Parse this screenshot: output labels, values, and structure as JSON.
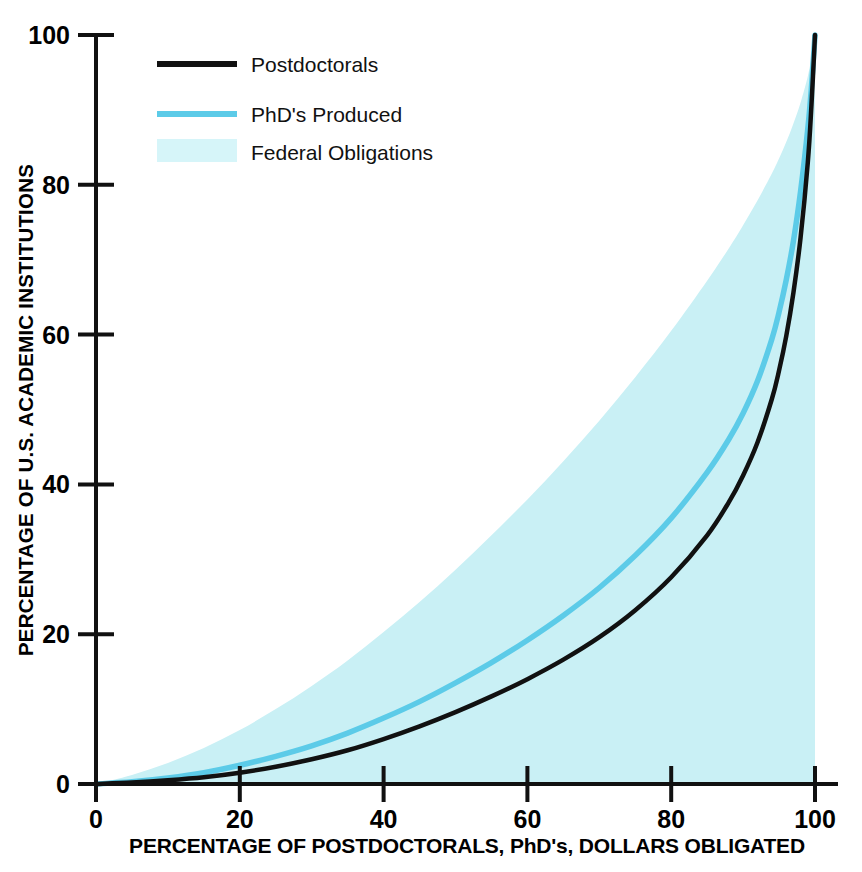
{
  "chart_data": {
    "type": "line",
    "title": "",
    "xlabel": "PERCENTAGE OF POSTDOCTORALS, PhD's, DOLLARS OBLIGATED",
    "ylabel": "PERCENTAGE OF U.S. ACADEMIC INSTITUTIONS",
    "xlim": [
      0,
      100
    ],
    "ylim": [
      0,
      100
    ],
    "xticks": [
      "0",
      "20",
      "40",
      "60",
      "80",
      "100"
    ],
    "xtick_values": [
      0,
      20,
      40,
      60,
      80,
      100
    ],
    "yticks": [
      "0",
      "20",
      "40",
      "60",
      "80",
      "100"
    ],
    "ytick_values": [
      0,
      20,
      40,
      60,
      80,
      100
    ],
    "grid": false,
    "legend_position": "top-left-inside",
    "colors": {
      "postdoctorals_line": "#111111",
      "phds_line": "#5ccbe8",
      "federal_fill": "#c9f0f5",
      "axis": "#111111",
      "background": "#ffffff"
    },
    "x": [
      0,
      5,
      10,
      15,
      20,
      25,
      30,
      35,
      40,
      45,
      50,
      55,
      60,
      65,
      70,
      75,
      80,
      85,
      88,
      90,
      92,
      94,
      95,
      96,
      97,
      98,
      99,
      99.5,
      100
    ],
    "series": [
      {
        "name": "Postdoctorals",
        "style": "line",
        "color": "#111111",
        "values": [
          0,
          0.2,
          0.5,
          0.9,
          1.5,
          2.3,
          3.3,
          4.5,
          6.0,
          7.7,
          9.6,
          11.7,
          14.0,
          16.6,
          19.6,
          23.2,
          27.6,
          33.2,
          37.6,
          41.2,
          45.6,
          51.4,
          55.2,
          59.8,
          65.6,
          73.0,
          83.0,
          90.5,
          100
        ]
      },
      {
        "name": "PhD's Produced",
        "style": "line",
        "color": "#5ccbe8",
        "values": [
          0,
          0.3,
          0.8,
          1.5,
          2.5,
          3.7,
          5.1,
          6.8,
          8.8,
          11.0,
          13.5,
          16.2,
          19.2,
          22.5,
          26.2,
          30.5,
          35.5,
          41.6,
          46.0,
          49.5,
          53.8,
          59.4,
          63.0,
          67.3,
          72.5,
          79.2,
          87.5,
          93.0,
          100
        ]
      },
      {
        "name": "Federal Obligations",
        "style": "area",
        "color": "#c9f0f5",
        "values": [
          0,
          1.2,
          2.8,
          4.8,
          7.2,
          10.0,
          13.1,
          16.5,
          20.3,
          24.3,
          28.6,
          33.2,
          38.0,
          43.1,
          48.5,
          54.3,
          60.5,
          67.2,
          71.5,
          74.6,
          77.9,
          81.5,
          83.5,
          85.7,
          88.2,
          91.0,
          94.5,
          97.0,
          100
        ]
      }
    ]
  },
  "legend": {
    "items": [
      {
        "label": "Postdoctorals",
        "swatch": "line-dark",
        "color": "#111111"
      },
      {
        "label": "PhD's Produced",
        "swatch": "line-cyan",
        "color": "#5ccbe8"
      },
      {
        "label": "Federal Obligations",
        "swatch": "area-cyan",
        "color": "#c9f0f5"
      }
    ]
  },
  "axes": {
    "x_title": "PERCENTAGE OF POSTDOCTORALS, PhD's, DOLLARS OBLIGATED",
    "y_title": "PERCENTAGE OF U.S. ACADEMIC INSTITUTIONS",
    "x_ticks": [
      "0",
      "20",
      "40",
      "60",
      "80",
      "100"
    ],
    "y_ticks": [
      "0",
      "20",
      "40",
      "60",
      "80",
      "100"
    ]
  }
}
